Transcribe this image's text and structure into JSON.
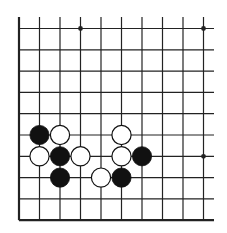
{
  "board": {
    "description": "Go board diagram fragment (lower-left corner region)",
    "columns": 10,
    "rows": 10,
    "edges": [
      "left",
      "bottom"
    ],
    "colors": {
      "line": "#222222",
      "black_stone": "#111111",
      "white_stone": "#ffffff",
      "background": "#ffffff"
    },
    "star_points": [
      {
        "col": 3,
        "row": 0
      },
      {
        "col": 9,
        "row": 0
      },
      {
        "col": 9,
        "row": 6
      }
    ],
    "stones": [
      {
        "color": "black",
        "col": 1,
        "row": 5
      },
      {
        "color": "white",
        "col": 2,
        "row": 5
      },
      {
        "color": "white",
        "col": 5,
        "row": 5
      },
      {
        "color": "white",
        "col": 1,
        "row": 6
      },
      {
        "color": "black",
        "col": 2,
        "row": 6
      },
      {
        "color": "white",
        "col": 3,
        "row": 6
      },
      {
        "color": "white",
        "col": 5,
        "row": 6
      },
      {
        "color": "black",
        "col": 6,
        "row": 6
      },
      {
        "color": "black",
        "col": 2,
        "row": 7
      },
      {
        "color": "white",
        "col": 4,
        "row": 7
      },
      {
        "color": "black",
        "col": 5,
        "row": 7
      }
    ]
  }
}
